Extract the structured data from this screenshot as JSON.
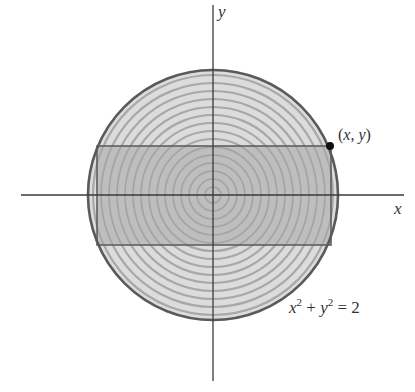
{
  "figure": {
    "axes": {
      "x_label": "x",
      "y_label": "y",
      "origin_px": [
        213,
        195
      ],
      "x_axis_range_px": [
        21,
        404
      ],
      "y_axis_range_px": [
        5,
        381
      ]
    },
    "circle": {
      "equation_parts": {
        "x": "x",
        "x_exp": "2",
        "plus": " + ",
        "y": "y",
        "y_exp": "2",
        "eq": " = 2"
      },
      "equation": "x² + y² = 2",
      "center_px": [
        213,
        195
      ],
      "radius_px": 126,
      "ring_count": 16,
      "fill_color": "#dcdcdc",
      "ring_color": "#a8a8a8",
      "edge_color": "#5a5a5a"
    },
    "rectangle": {
      "left_px": 97,
      "right_px": 331,
      "top_px": 146,
      "bottom_px": 245,
      "fill_color": "#b9b9b9",
      "edge_color": "#5f5f5f"
    },
    "point": {
      "label": "(x, y)",
      "label_parts": {
        "open": "(",
        "x": "x",
        "comma": ", ",
        "y": "y",
        "close": ")"
      },
      "px": [
        330,
        146
      ],
      "color": "#111111"
    }
  }
}
